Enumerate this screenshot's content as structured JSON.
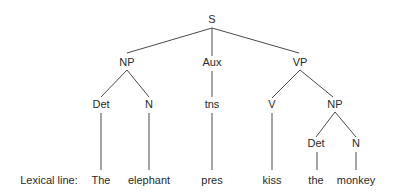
{
  "diagram": {
    "type": "syntax-tree",
    "lexical_line_label": "Lexical line:",
    "nodes": [
      {
        "id": "S",
        "label": "S",
        "x": 212,
        "y": 23
      },
      {
        "id": "NP1",
        "label": "NP",
        "x": 127,
        "y": 66
      },
      {
        "id": "Aux",
        "label": "Aux",
        "x": 212,
        "y": 66
      },
      {
        "id": "VP",
        "label": "VP",
        "x": 300,
        "y": 66
      },
      {
        "id": "Det1",
        "label": "Det",
        "x": 101,
        "y": 108
      },
      {
        "id": "N1",
        "label": "N",
        "x": 149,
        "y": 108
      },
      {
        "id": "tns",
        "label": "tns",
        "x": 212,
        "y": 108
      },
      {
        "id": "V",
        "label": "V",
        "x": 272,
        "y": 108
      },
      {
        "id": "NP2",
        "label": "NP",
        "x": 335,
        "y": 108
      },
      {
        "id": "Det2",
        "label": "Det",
        "x": 316,
        "y": 147
      },
      {
        "id": "N2",
        "label": "N",
        "x": 356,
        "y": 147
      }
    ],
    "lexical_items": [
      {
        "id": "w1",
        "label": "The",
        "x": 101,
        "parent": "Det1"
      },
      {
        "id": "w2",
        "label": "elephant",
        "x": 149,
        "parent": "N1"
      },
      {
        "id": "w3",
        "label": "pres",
        "x": 212,
        "parent": "tns"
      },
      {
        "id": "w4",
        "label": "kiss",
        "x": 272,
        "parent": "V"
      },
      {
        "id": "w5",
        "label": "the",
        "x": 316,
        "parent": "Det2"
      },
      {
        "id": "w6",
        "label": "monkey",
        "x": 356,
        "parent": "N2"
      }
    ],
    "edges": [
      [
        "S",
        "NP1"
      ],
      [
        "S",
        "Aux"
      ],
      [
        "S",
        "VP"
      ],
      [
        "NP1",
        "Det1"
      ],
      [
        "NP1",
        "N1"
      ],
      [
        "Aux",
        "tns"
      ],
      [
        "VP",
        "V"
      ],
      [
        "VP",
        "NP2"
      ],
      [
        "NP2",
        "Det2"
      ],
      [
        "NP2",
        "N2"
      ]
    ]
  }
}
